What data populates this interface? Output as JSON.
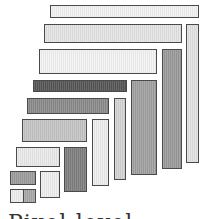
{
  "diagram": {
    "type": "nested-rectangle-layout",
    "rects": [
      {
        "id": "h1",
        "x": 50,
        "y": 5,
        "w": 149,
        "h": 13,
        "fill": "#f2f2f2"
      },
      {
        "id": "h2",
        "x": 44,
        "y": 24,
        "w": 138,
        "h": 19,
        "fill": "#e4e4e4"
      },
      {
        "id": "v2",
        "x": 186,
        "y": 24,
        "w": 13,
        "h": 139,
        "fill": "#e2e2e2"
      },
      {
        "id": "h3",
        "x": 39,
        "y": 49,
        "w": 118,
        "h": 25,
        "fill": "#f3f3f3"
      },
      {
        "id": "v3",
        "x": 162,
        "y": 49,
        "w": 20,
        "h": 120,
        "fill": "#9a9a9a"
      },
      {
        "id": "h4",
        "x": 33,
        "y": 80,
        "w": 94,
        "h": 12,
        "fill": "#555555"
      },
      {
        "id": "v4",
        "x": 131,
        "y": 80,
        "w": 26,
        "h": 95,
        "fill": "#a0a0a0"
      },
      {
        "id": "h5",
        "x": 27,
        "y": 98,
        "w": 82,
        "h": 16,
        "fill": "#8a8a8a"
      },
      {
        "id": "v5",
        "x": 114,
        "y": 98,
        "w": 12,
        "h": 82,
        "fill": "#d4d4d4"
      },
      {
        "id": "h6",
        "x": 22,
        "y": 119,
        "w": 65,
        "h": 23,
        "fill": "#c4c4c4"
      },
      {
        "id": "v6",
        "x": 92,
        "y": 119,
        "w": 17,
        "h": 67,
        "fill": "#eeeeee"
      },
      {
        "id": "h7",
        "x": 16,
        "y": 147,
        "w": 44,
        "h": 20,
        "fill": "#eaeaea"
      },
      {
        "id": "v7",
        "x": 64,
        "y": 147,
        "w": 23,
        "h": 45,
        "fill": "#7e7e7e"
      },
      {
        "id": "h8",
        "x": 10,
        "y": 171,
        "w": 26,
        "h": 14,
        "fill": "#9c9c9c"
      },
      {
        "id": "v8",
        "x": 40,
        "y": 171,
        "w": 20,
        "h": 27,
        "fill": "#efefef"
      },
      {
        "id": "s9a",
        "x": 10,
        "y": 189,
        "w": 14,
        "h": 14,
        "fill": "#eeeeee"
      },
      {
        "id": "s9b",
        "x": 23,
        "y": 189,
        "w": 13,
        "h": 14,
        "fill": "#a8a8a8"
      }
    ],
    "caption": "Pixel-level"
  }
}
